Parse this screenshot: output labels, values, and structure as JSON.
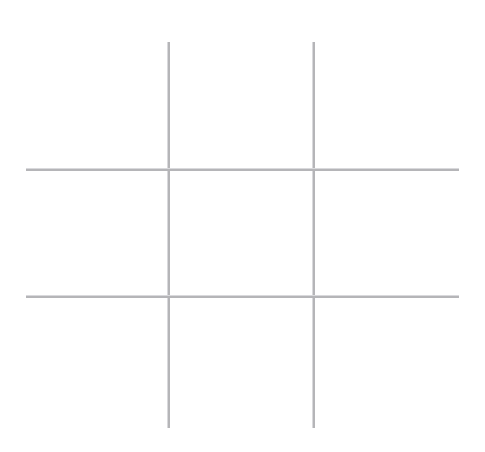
{
  "board": {
    "title": "Tic Tac Toe",
    "background_color": "#ffffff",
    "line_color": "#b5b5b8",
    "line_soft_edge_color": "#d9d9dc",
    "line_thickness_px": 2,
    "status": "",
    "vertical_lines": [
      {
        "name": "vertical-line-left",
        "x": 168,
        "y_start": 42,
        "y_end": 428
      },
      {
        "name": "vertical-line-right",
        "x": 313,
        "y_start": 42,
        "y_end": 428
      }
    ],
    "horizontal_lines": [
      {
        "name": "horizontal-line-top",
        "y": 169,
        "x_start": 26,
        "x_end": 459
      },
      {
        "name": "horizontal-line-bottom",
        "y": 296,
        "x_start": 26,
        "x_end": 459
      }
    ],
    "cells": [
      {
        "id": "cell-top-left",
        "row": 0,
        "col": 0,
        "mark": ""
      },
      {
        "id": "cell-top-center",
        "row": 0,
        "col": 1,
        "mark": ""
      },
      {
        "id": "cell-top-right",
        "row": 0,
        "col": 2,
        "mark": ""
      },
      {
        "id": "cell-middle-left",
        "row": 1,
        "col": 0,
        "mark": ""
      },
      {
        "id": "cell-middle-center",
        "row": 1,
        "col": 1,
        "mark": ""
      },
      {
        "id": "cell-middle-right",
        "row": 1,
        "col": 2,
        "mark": ""
      },
      {
        "id": "cell-bottom-left",
        "row": 2,
        "col": 0,
        "mark": ""
      },
      {
        "id": "cell-bottom-center",
        "row": 2,
        "col": 1,
        "mark": ""
      },
      {
        "id": "cell-bottom-right",
        "row": 2,
        "col": 2,
        "mark": ""
      }
    ]
  }
}
